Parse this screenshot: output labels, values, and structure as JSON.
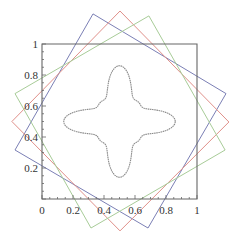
{
  "chart_data": {
    "type": "line",
    "title": "",
    "xlabel": "",
    "ylabel": "",
    "xlim": [
      0,
      1
    ],
    "ylim": [
      0,
      1
    ],
    "grid": false,
    "legend": null,
    "x_ticks": [
      "0",
      "0.2",
      "0.4",
      "0.6",
      "0.8",
      "1"
    ],
    "y_ticks": [
      "0.2",
      "0.4",
      "0.6",
      "0.8",
      "1"
    ],
    "x_tick_values": [
      0,
      0.2,
      0.4,
      0.6,
      0.8,
      1
    ],
    "y_tick_values": [
      0.2,
      0.4,
      0.6,
      0.8,
      1
    ],
    "center": [
      0.5,
      0.5
    ],
    "series": [
      {
        "name": "frame-square",
        "color": "#666666",
        "shape": "square",
        "vertices": [
          [
            0,
            0
          ],
          [
            1,
            0
          ],
          [
            1,
            1
          ],
          [
            0,
            1
          ]
        ]
      },
      {
        "name": "blue-rotated-square",
        "color": "#7b7fb5",
        "shape": "square",
        "vertices": [
          [
            0.329,
            1.194
          ],
          [
            1.187,
            0.68
          ],
          [
            0.684,
            -0.187
          ],
          [
            -0.174,
            0.316
          ]
        ]
      },
      {
        "name": "red-rotated-square",
        "color": "#e0908a",
        "shape": "square",
        "vertices": [
          [
            0.503,
            1.213
          ],
          [
            1.206,
            0.497
          ],
          [
            0.503,
            -0.206
          ],
          [
            -0.194,
            0.5
          ]
        ]
      },
      {
        "name": "green-rotated-square",
        "color": "#a8cc98",
        "shape": "square",
        "vertices": [
          [
            0.69,
            1.181
          ],
          [
            1.181,
            0.316
          ],
          [
            0.316,
            -0.187
          ],
          [
            -0.174,
            0.68
          ]
        ]
      },
      {
        "name": "four-lobed-star-curve",
        "color": "#8a8a8a",
        "shape": "closed-curve",
        "description": "4-lobed star centered at (0.5,0.5); lobes reach ~0.33 from center along axes, waist ~0.15 along diagonals",
        "lobe_tips": [
          [
            0.5,
            0.83
          ],
          [
            0.83,
            0.5
          ],
          [
            0.5,
            0.17
          ],
          [
            0.17,
            0.5
          ]
        ]
      }
    ]
  }
}
